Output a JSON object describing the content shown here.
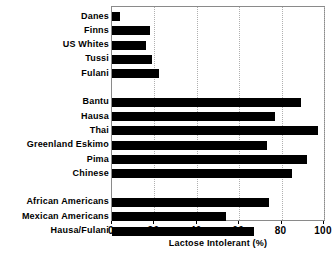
{
  "chart_data": {
    "type": "bar",
    "orientation": "horizontal",
    "title": "",
    "xlabel": "Lactose Intolerant (%)",
    "ylabel": "",
    "xlim": [
      0,
      100
    ],
    "xticks": [
      0,
      20,
      40,
      60,
      80,
      100
    ],
    "xtick_labels": [
      "0",
      "20",
      "40",
      "60",
      "80",
      "100"
    ],
    "grid": "vertical-dotted",
    "legend": "none",
    "bar_color": "#000000",
    "groups": [
      {
        "name": "group-1",
        "categories": [
          "Danes",
          "Finns",
          "US Whites",
          "Tussi",
          "Fulani"
        ],
        "values": [
          4,
          18,
          16,
          19,
          22
        ]
      },
      {
        "name": "group-2",
        "categories": [
          "Bantu",
          "Hausa",
          "Thai",
          "Greenland Eskimo",
          "Pima",
          "Chinese"
        ],
        "values": [
          89,
          77,
          97,
          73,
          92,
          85
        ]
      },
      {
        "name": "group-3",
        "categories": [
          "African Americans",
          "Mexican Americans",
          "Hausa/Fulani"
        ],
        "values": [
          74,
          54,
          67
        ]
      }
    ],
    "categories": [
      "Danes",
      "Finns",
      "US Whites",
      "Tussi",
      "Fulani",
      "Bantu",
      "Hausa",
      "Thai",
      "Greenland Eskimo",
      "Pima",
      "Chinese",
      "African Americans",
      "Mexican Americans",
      "Hausa/Fulani"
    ],
    "values": [
      4,
      18,
      16,
      19,
      22,
      89,
      77,
      97,
      73,
      92,
      85,
      74,
      54,
      67
    ]
  }
}
